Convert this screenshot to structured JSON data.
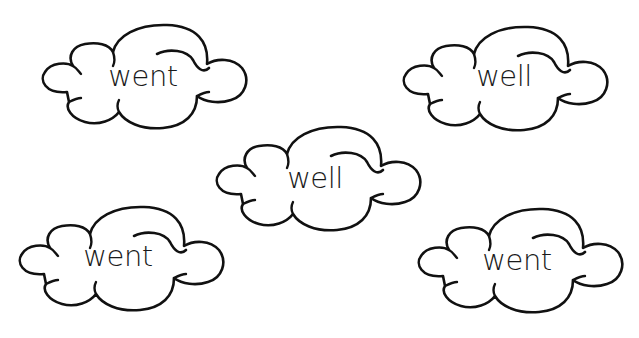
{
  "worksheet": {
    "clouds": [
      {
        "word": "went",
        "left": 37,
        "top": 22,
        "text_left": 30,
        "text_top": 40
      },
      {
        "word": "well",
        "left": 398,
        "top": 24,
        "text_left": 30,
        "text_top": 38
      },
      {
        "word": "well",
        "left": 211,
        "top": 124,
        "text_left": 28,
        "text_top": 40
      },
      {
        "word": "went",
        "left": 14,
        "top": 204,
        "text_left": 28,
        "text_top": 38
      },
      {
        "word": "went",
        "left": 413,
        "top": 206,
        "text_left": 28,
        "text_top": 40
      }
    ],
    "colors": {
      "background": "#ffffff",
      "outline": "#111111",
      "text": "#1a1a1a"
    }
  }
}
